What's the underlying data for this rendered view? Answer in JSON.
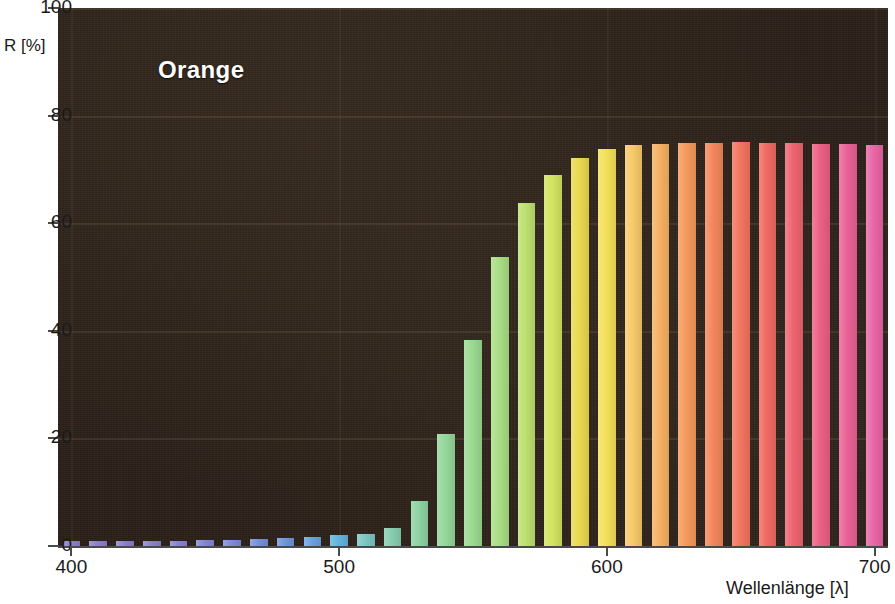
{
  "chart_data": {
    "type": "bar",
    "title": "Orange",
    "xlabel": "Wellenlänge [λ]",
    "ylabel": "R [%]",
    "xlim": [
      395,
      705
    ],
    "ylim": [
      0,
      100
    ],
    "grid": true,
    "legend_position": "none",
    "plot_background": "#2b2119",
    "title_color": "#ffffff",
    "xticks": [
      400,
      500,
      600,
      700
    ],
    "xtick_labels": [
      "400",
      "500",
      "600",
      "700"
    ],
    "yticks": [
      0,
      20,
      40,
      60,
      80,
      100
    ],
    "ytick_labels": [
      "0",
      "20",
      "40",
      "60",
      "80",
      "100"
    ],
    "x": [
      400,
      410,
      420,
      430,
      440,
      450,
      460,
      470,
      480,
      490,
      500,
      510,
      520,
      530,
      540,
      550,
      560,
      570,
      580,
      590,
      600,
      610,
      620,
      630,
      640,
      650,
      660,
      670,
      680,
      690,
      700
    ],
    "values": [
      1.0,
      1.0,
      1.0,
      1.0,
      1.0,
      1.1,
      1.2,
      1.3,
      1.4,
      1.6,
      2.0,
      2.2,
      3.3,
      8.3,
      20.8,
      38.2,
      53.8,
      63.8,
      69.0,
      72.2,
      73.8,
      74.6,
      74.8,
      74.9,
      75.0,
      75.1,
      75.0,
      74.9,
      74.8,
      74.7,
      74.6
    ],
    "bar_colors": [
      "#8e80c6",
      "#8e80c6",
      "#8d81c8",
      "#8a83cc",
      "#8885cf",
      "#8487d2",
      "#7e8bd6",
      "#7790d9",
      "#6f96dc",
      "#68a3dd",
      "#62b4de",
      "#7cc6c4",
      "#86cdae",
      "#8ed3a2",
      "#94d79b",
      "#9bda92",
      "#a9de84",
      "#bde070",
      "#d2e45f",
      "#ead94f",
      "#f5e05a",
      "#f7c96a",
      "#f6b163",
      "#f59a5c",
      "#f3865c",
      "#f2755f",
      "#f06a62",
      "#ee6470",
      "#ec6084",
      "#ea6195",
      "#e866a4"
    ],
    "series_name": "Orange"
  },
  "axis": {
    "y_title": "R [%]",
    "x_title": "Wellenlänge [λ]"
  }
}
